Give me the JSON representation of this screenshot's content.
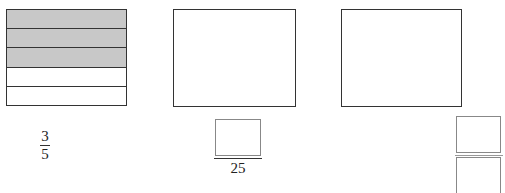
{
  "models": [
    {
      "id": "model-1",
      "type": "bar-model",
      "rows_total": 5,
      "rows_shaded": 3,
      "shaded_color": "#c8c8c8",
      "fraction": {
        "numerator": "3",
        "denominator": "5"
      }
    },
    {
      "id": "model-2",
      "type": "blank-model",
      "fraction": {
        "numerator": "",
        "denominator": "25"
      }
    },
    {
      "id": "model-3",
      "type": "blank-model",
      "fraction": {
        "numerator": "",
        "denominator": ""
      }
    }
  ]
}
